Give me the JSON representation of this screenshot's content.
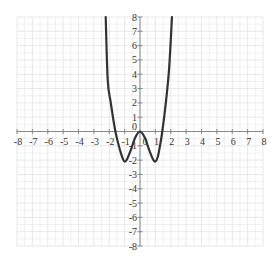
{
  "chart_data": {
    "type": "line",
    "title": "",
    "xlabel": "",
    "ylabel": "",
    "xlim": [
      -8,
      8
    ],
    "ylim": [
      -8,
      8
    ],
    "grid": true,
    "grid_step": 1,
    "minor_grid_step": 0.5,
    "x_tick_labels": [
      "-8",
      "-7",
      "-6",
      "-5",
      "-4",
      "-3",
      "-2",
      "-1",
      "0",
      "1",
      "2",
      "3",
      "4",
      "5",
      "6",
      "7",
      "8"
    ],
    "y_tick_labels": [
      "8",
      "7",
      "6",
      "5",
      "4",
      "3",
      "2",
      "1",
      "0",
      "-1",
      "-2",
      "-3",
      "-4",
      "-5",
      "-6",
      "-7",
      "-8"
    ],
    "series": [
      {
        "name": "f(x)",
        "description": "W-shaped quartic: local max at (0,0), minima near (-1,-2) and (1,-2), x-intercepts near -1.5, 0, 1.5",
        "points": [
          [
            -2.23,
            8
          ],
          [
            -2.1,
            3.6
          ],
          [
            -1.9,
            2
          ],
          [
            -1.6,
            0
          ],
          [
            -1.3,
            -1.3
          ],
          [
            -1.1,
            -1.95
          ],
          [
            -1.0,
            -2.1
          ],
          [
            -0.85,
            -1.95
          ],
          [
            -0.6,
            -1.3
          ],
          [
            -0.3,
            -0.4
          ],
          [
            0,
            0
          ],
          [
            0.3,
            -0.4
          ],
          [
            0.6,
            -1.3
          ],
          [
            0.85,
            -1.95
          ],
          [
            1.0,
            -2.1
          ],
          [
            1.15,
            -1.8
          ],
          [
            1.3,
            -1.0
          ],
          [
            1.45,
            0
          ],
          [
            1.7,
            2.2
          ],
          [
            1.9,
            4.5
          ],
          [
            2.08,
            8
          ]
        ]
      }
    ]
  },
  "colors": {
    "grid": "#e2e2e2",
    "axis": "#888888",
    "curve": "#333333",
    "label": "#333333"
  }
}
